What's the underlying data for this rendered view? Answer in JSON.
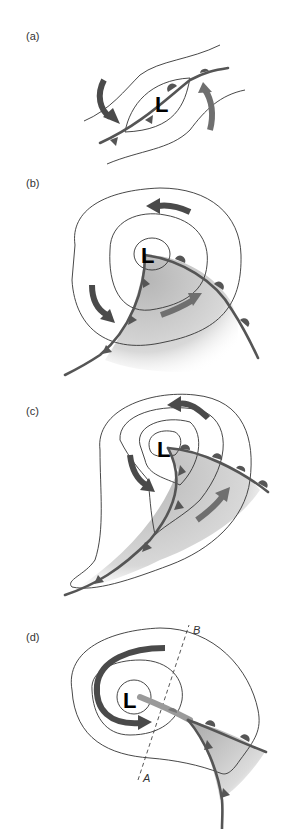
{
  "figure": {
    "panels": [
      {
        "id": "a",
        "label": "(a)",
        "low_symbol": "L",
        "stage": "initial wave along stationary front"
      },
      {
        "id": "b",
        "label": "(b)",
        "low_symbol": "L",
        "stage": "open wave with cold and warm fronts"
      },
      {
        "id": "c",
        "label": "(c)",
        "low_symbol": "L",
        "stage": "cold front overtaking warm front"
      },
      {
        "id": "d",
        "label": "(d)",
        "low_symbol": "L",
        "stage": "occluded cyclone",
        "section_line": {
          "start": "A",
          "end": "B"
        }
      }
    ],
    "legend_items": {
      "cold_front": "triangle-marks",
      "warm_front": "semicircle-marks",
      "warm_sector": "gray-shaded",
      "wind_arrows": "curved-arrows",
      "isobars": "thin-black-lines"
    },
    "colors": {
      "front": "#555555",
      "arrow_dark": "#4a4a4a",
      "arrow_light": "#6f6f6f",
      "isobar": "#333333",
      "warm_sector": "#bdbdbd"
    }
  }
}
